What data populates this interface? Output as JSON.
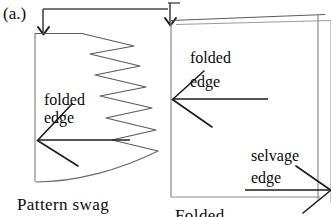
{
  "figure": {
    "panel_label": "(a.)",
    "left_diagram": {
      "caption": "Pattern  swag",
      "annotations": [
        {
          "name": "folded-edge",
          "line1": "folded",
          "line2": "edge"
        }
      ],
      "shape": "pattern swag outline with zigzag right edge and curved bottom"
    },
    "right_diagram": {
      "caption": "Folded",
      "annotations": [
        {
          "name": "folded-edge",
          "line1": "folded",
          "line2": "edge"
        },
        {
          "name": "selvage-edge",
          "line1": "selvage",
          "line2": "edge"
        }
      ],
      "shape": "folded fabric rectangle"
    },
    "colors": {
      "ink": "#0a0a0a",
      "line": "#4a4a4a",
      "paper": "#ffffff"
    }
  }
}
